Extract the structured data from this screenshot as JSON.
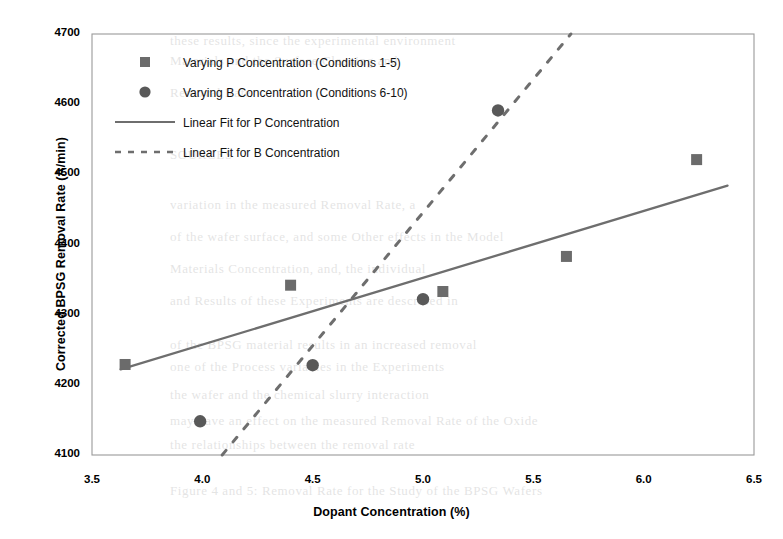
{
  "chart_data": {
    "type": "scatter",
    "title": "",
    "xlabel": "Dopant Concentration (%)",
    "ylabel": "Corrected BPSG Removal Rate (A/min)",
    "xlim": [
      3.5,
      6.5
    ],
    "ylim": [
      4100,
      4700
    ],
    "xticks": [
      "3.5",
      "4.0",
      "4.5",
      "5.0",
      "5.5",
      "6.0",
      "6.5"
    ],
    "yticks": [
      "4100",
      "4200",
      "4300",
      "4400",
      "4500",
      "4600",
      "4700"
    ],
    "grid": false,
    "legend_position": "upper-left-inside",
    "series": [
      {
        "name": "Varying P Concentration (Conditions 1-5)",
        "marker": "square",
        "color": "#6b6b6b",
        "points": [
          {
            "x": 3.65,
            "y": 4229
          },
          {
            "x": 4.4,
            "y": 4342
          },
          {
            "x": 5.09,
            "y": 4333
          },
          {
            "x": 5.65,
            "y": 4383
          },
          {
            "x": 6.24,
            "y": 4521
          }
        ]
      },
      {
        "name": "Varying B Concentration (Conditions 6-10)",
        "marker": "circle",
        "color": "#595959",
        "points": [
          {
            "x": 3.99,
            "y": 4148
          },
          {
            "x": 4.5,
            "y": 4228
          },
          {
            "x": 5.0,
            "y": 4322
          },
          {
            "x": 5.34,
            "y": 4591
          },
          {
            "x": 5.34,
            "y": 4591
          }
        ]
      }
    ],
    "fits": [
      {
        "name": "Linear Fit for P Concentration",
        "style": "solid",
        "color": "#6e6e6e",
        "x_start": 3.63,
        "y_start": 4222,
        "x_end": 6.38,
        "y_end": 4484
      },
      {
        "name": "Linear Fit for B Concentration",
        "style": "dashed",
        "color": "#6e6e6e",
        "x_start": 4.09,
        "y_start": 4100,
        "x_end": 5.67,
        "y_end": 4700
      }
    ],
    "legend": [
      {
        "label": "Varying P Concentration (Conditions 1-5)",
        "kind": "marker",
        "marker": "square"
      },
      {
        "label": "Varying B Concentration (Conditions 6-10)",
        "kind": "marker",
        "marker": "circle"
      },
      {
        "label": "Linear Fit for P Concentration",
        "kind": "line",
        "style": "solid"
      },
      {
        "label": "Linear Fit for B Concentration",
        "kind": "line",
        "style": "dashed"
      }
    ]
  },
  "background_text": {
    "lines": [
      "these results, since the experimental environment",
      "Materials and the Surface Cleaning and",
      "Removal Rate",
      "SOURCES",
      "variation in the measured Removal Rate, a",
      "of the wafer surface, and some Other effects in the Model",
      "Materials Concentration, and, the individual",
      "and Results of these Experiments are described in",
      "of the BPSG material results in an increased removal",
      "one of the Process variables in the Experiments",
      "the wafer and the chemical slurry interaction",
      "may have an effect on the measured Removal Rate of the Oxide",
      "the relationships between the removal rate",
      "Figure 4 and 5: Removal Rate for the Study of the BPSG Wafers"
    ]
  }
}
